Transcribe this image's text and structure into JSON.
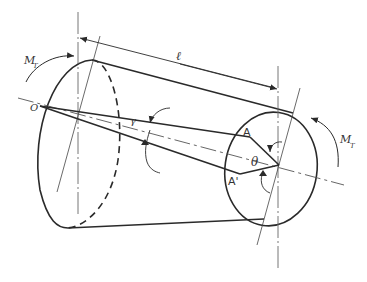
{
  "figure": {
    "labels": {
      "torque_left": "M",
      "torque_left_sub": "T",
      "torque_right": "M",
      "torque_right_sub": "T",
      "length": "ℓ",
      "origin": "O",
      "shear_strain": "γ",
      "point_a": "A",
      "point_a_prime": "A'",
      "twist_angle": "θ"
    }
  },
  "colors": {
    "line": "#2a2a2a",
    "centerline": "#555555",
    "background": "#ffffff"
  }
}
